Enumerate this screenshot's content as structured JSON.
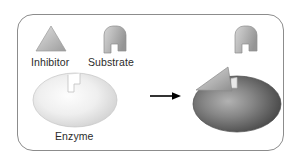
{
  "figure": {
    "background_color": "#ffffff",
    "frame_color": "#8c8c8c",
    "width": 301,
    "height": 167
  },
  "labels": {
    "inhibitor": "Inhibitor",
    "substrate": "Substrate",
    "enzyme": "Enzyme"
  },
  "colors": {
    "inhibitor_light": "#d8d8d8",
    "inhibitor_mid": "#b4b4b4",
    "inhibitor_dark": "#9a9a9a",
    "substrate_light": "#cfcfcf",
    "substrate_mid": "#b0b0b0",
    "substrate_dark": "#8f8f8f",
    "enzyme_free_light": "#fbfbfb",
    "enzyme_free_mid": "#e6e6e6",
    "enzyme_free_dark": "#c6c6c6",
    "enzyme_bound_light": "#a9a9a9",
    "enzyme_bound_mid": "#707070",
    "enzyme_bound_dark": "#3c3c3c",
    "arrow": "#000000",
    "text": "#2b2b2b"
  },
  "elements": {
    "inhibitor_shape": "triangle",
    "substrate_shape": "key-hook",
    "enzyme_shape": "ellipse-with-notched-active-site",
    "arrow_direction": "right",
    "free_enzyme_state": "active site open",
    "bound_enzyme_state": "inhibitor bound to active site"
  }
}
